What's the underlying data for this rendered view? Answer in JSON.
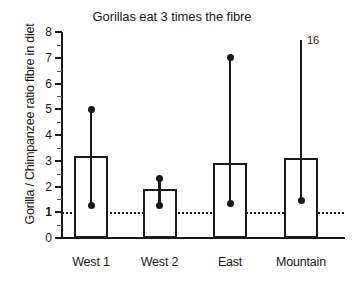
{
  "chart_data": {
    "type": "bar",
    "title": "Gorillas eat 3 times the fibre",
    "xlabel": "",
    "ylabel": "Gorilla / Chimpanzee ratio fibre in diet",
    "categories": [
      "West 1",
      "West 2",
      "East",
      "Mountain"
    ],
    "values": [
      3.2,
      1.9,
      2.9,
      3.1
    ],
    "error_low": [
      1.25,
      1.25,
      1.35,
      1.45
    ],
    "error_high": [
      5.0,
      2.3,
      7.0,
      16
    ],
    "error_high_labels": [
      "",
      "",
      "",
      "16"
    ],
    "error_high_clipped": [
      false,
      false,
      false,
      true
    ],
    "ylim": [
      0,
      8
    ],
    "yticks": [
      0,
      1,
      2,
      3,
      4,
      5,
      6,
      7,
      8
    ],
    "ytick_labels": [
      "0",
      "1",
      "2",
      "3",
      "4",
      "5",
      "6",
      "7",
      "8"
    ],
    "reference_line": 1,
    "grid": false,
    "legend": "none",
    "bar_color": "#ffffff",
    "bar_edge_color": "#1a1a1a",
    "marker_color": "#1a1a1a"
  }
}
